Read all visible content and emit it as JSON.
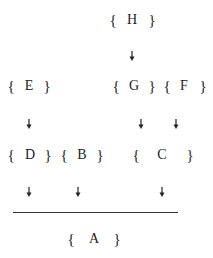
{
  "diagram": {
    "nodes": [
      {
        "id": "H",
        "label": "H",
        "x": 132,
        "y": 20,
        "lb": 113,
        "rb": 152
      },
      {
        "id": "E",
        "label": "E",
        "x": 29,
        "y": 86,
        "lb": 11,
        "rb": 47
      },
      {
        "id": "G",
        "label": "G",
        "x": 134,
        "y": 86,
        "lb": 116,
        "rb": 152
      },
      {
        "id": "F",
        "label": "F",
        "x": 184,
        "y": 86,
        "lb": 167,
        "rb": 203
      },
      {
        "id": "D",
        "label": "D",
        "x": 30,
        "y": 155,
        "lb": 11,
        "rb": 48
      },
      {
        "id": "B",
        "label": "B",
        "x": 82,
        "y": 155,
        "lb": 64,
        "rb": 100
      },
      {
        "id": "C",
        "label": "C",
        "x": 162,
        "y": 155,
        "lb": 136,
        "rb": 190
      },
      {
        "id": "A",
        "label": "A",
        "x": 94,
        "y": 239,
        "lb": 71,
        "rb": 117
      }
    ],
    "arrows": [
      {
        "from": "H",
        "to": "G",
        "x": 132,
        "y": 52
      },
      {
        "from": "E",
        "to": "D",
        "x": 29,
        "y": 120
      },
      {
        "from": "G",
        "to": "C",
        "x": 141,
        "y": 120
      },
      {
        "from": "F",
        "to": "C",
        "x": 176,
        "y": 120
      },
      {
        "from": "D",
        "to": "line",
        "x": 29,
        "y": 188
      },
      {
        "from": "B",
        "to": "line",
        "x": 78,
        "y": 188
      },
      {
        "from": "C",
        "to": "line",
        "x": 162,
        "y": 188
      }
    ],
    "line": {
      "x1": 13,
      "x2": 178,
      "y": 212
    },
    "brace_open": "{",
    "brace_close": "}",
    "arrow_icon": "down-arrow-icon"
  }
}
